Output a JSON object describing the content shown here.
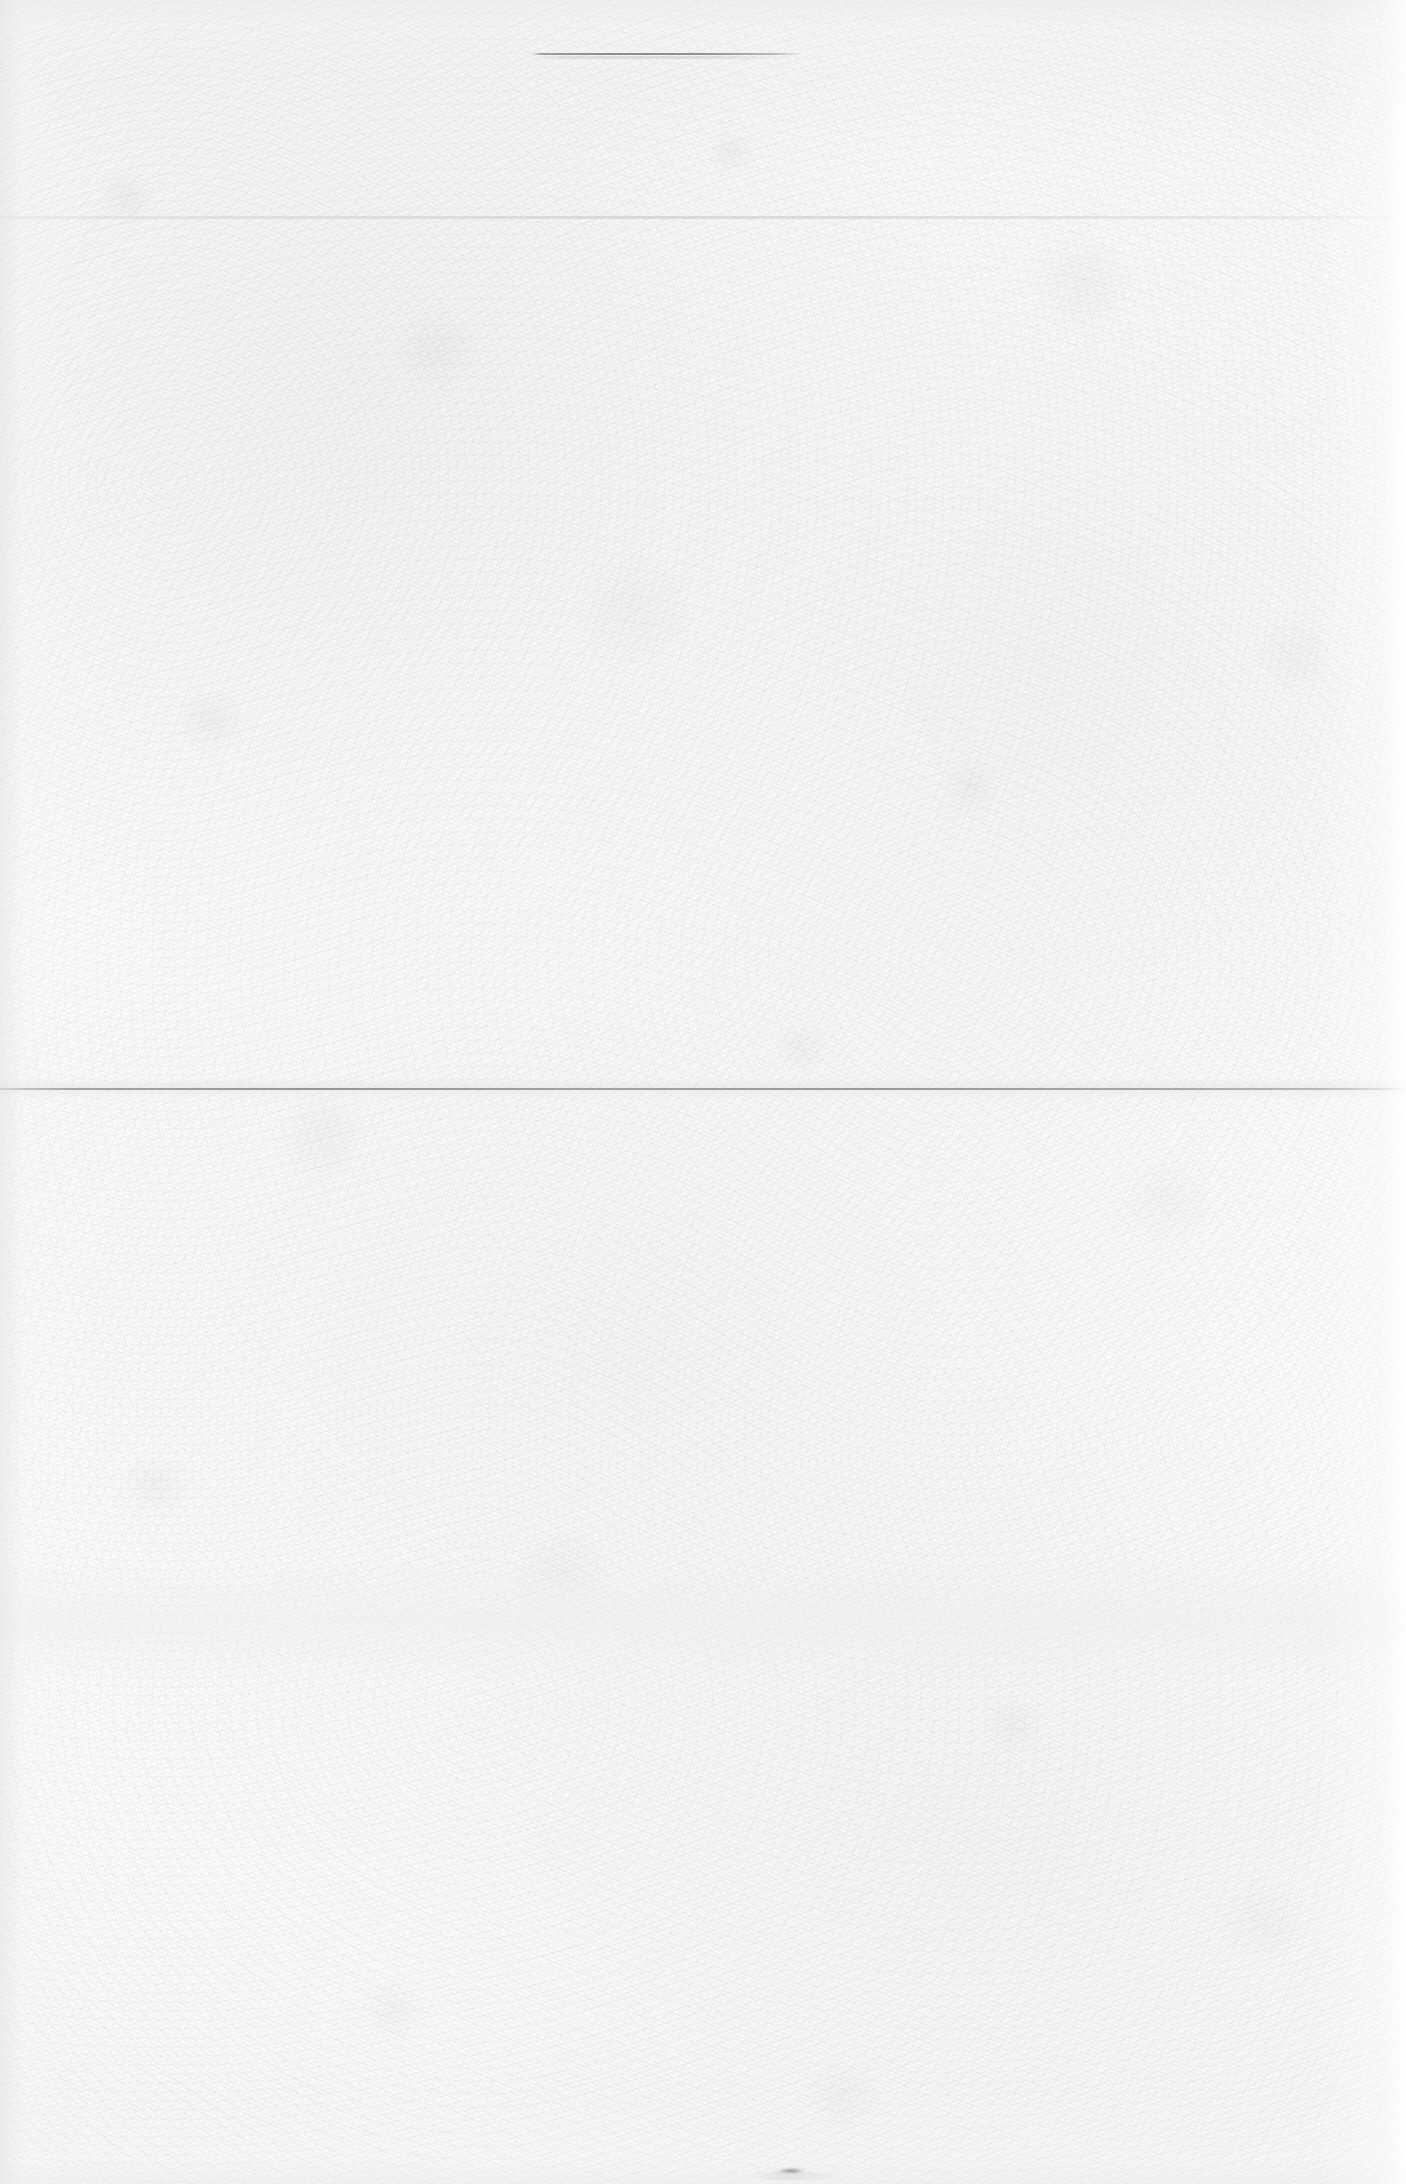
{
  "document": {
    "kind": "scanned-blank-page",
    "page_width": 1406,
    "page_height": 2184,
    "visible_text": "",
    "text_content_note": "",
    "background_color": "#fdfdfd",
    "ink_color": "#7a7c84"
  },
  "marks": {
    "top_rule": {
      "name": "top-horizontal-rule",
      "x": 531,
      "y": 53,
      "width": 272,
      "height": 2,
      "color": "#76787f"
    },
    "top_rule_shadow": {
      "x": 531,
      "y": 56,
      "width": 272,
      "height": 3,
      "color": "#b8babf"
    },
    "upper_crease": {
      "name": "upper-paper-crease",
      "x": 0,
      "y": 216,
      "width": 1406,
      "height": 3,
      "color": "#c9cbd0"
    },
    "middle_fold": {
      "name": "middle-fold-line",
      "x": 0,
      "y": 1088,
      "width": 1406,
      "height": 2,
      "color": "#82848c"
    },
    "middle_fold_halo": {
      "x": 0,
      "y": 1078,
      "width": 1406,
      "height": 22,
      "color": "#e6e6ea"
    },
    "lower_band": {
      "name": "lower-tonal-band",
      "x": 0,
      "y": 1560,
      "width": 1406,
      "height": 120,
      "color": "#eeeff2"
    },
    "bottom_smudge": {
      "name": "bottom-ink-smudge",
      "x": 772,
      "y": 2166,
      "width": 38,
      "height": 9,
      "color": "#56585e"
    },
    "bottom_smudge_tail": {
      "x": 748,
      "y": 2172,
      "width": 92,
      "height": 8,
      "color": "#a8aab0"
    }
  }
}
